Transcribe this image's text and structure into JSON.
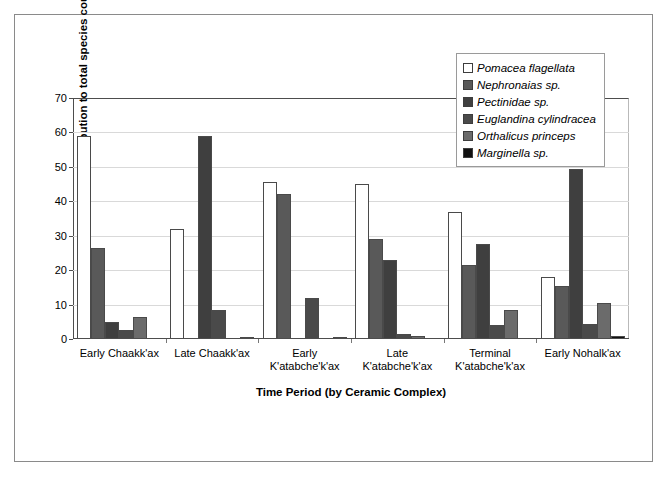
{
  "chart_data": {
    "type": "bar",
    "title": "",
    "xlabel": "Time Period (by Ceramic Complex)",
    "ylabel": "Percent contribution to total species count",
    "ylim": [
      0,
      70
    ],
    "yticks": [
      0,
      10,
      20,
      30,
      40,
      50,
      60,
      70
    ],
    "grid": true,
    "legend_position": "top-right",
    "categories": [
      "Early Chaakk'ax",
      "Late Chaakk'ax",
      "Early\nK'atabche'k'ax",
      "Late\nK'atabche'k'ax",
      "Terminal\nK'atabche'k'ax",
      "Early Nohalk'ax"
    ],
    "series": [
      {
        "name": "Pomacea flagellata",
        "color": "#ffffff",
        "values": [
          59.0,
          32.0,
          45.5,
          45.0,
          37.0,
          18.0
        ]
      },
      {
        "name": "Nephronaias sp.",
        "color": "#595959",
        "values": [
          26.5,
          0.0,
          42.0,
          29.0,
          21.5,
          15.5
        ]
      },
      {
        "name": "Pectinidae sp.",
        "color": "#3f3f3f",
        "values": [
          5.0,
          59.0,
          0.0,
          23.0,
          27.5,
          49.5
        ]
      },
      {
        "name": "Euglandina cylindracea",
        "color": "#4a4a4a",
        "values": [
          2.5,
          8.5,
          12.0,
          1.5,
          4.0,
          4.5
        ]
      },
      {
        "name": "Orthalicus princeps",
        "color": "#6b6b6b",
        "values": [
          6.5,
          0.0,
          0.0,
          1.0,
          8.5,
          10.5
        ]
      },
      {
        "name": "Marginella sp.",
        "color": "#111111",
        "values": [
          0.0,
          0.7,
          0.5,
          0.0,
          0.0,
          0.8
        ]
      }
    ]
  },
  "legend": {
    "items": [
      {
        "label": "Pomacea flagellata",
        "swatch": "#ffffff"
      },
      {
        "label": "Nephronaias sp.",
        "swatch": "#595959"
      },
      {
        "label": "Pectinidae sp.",
        "swatch": "#3f3f3f"
      },
      {
        "label": "Euglandina cylindracea",
        "swatch": "#4a4a4a"
      },
      {
        "label": "Orthalicus princeps",
        "swatch": "#6b6b6b"
      },
      {
        "label": "Marginella sp.",
        "swatch": "#111111"
      }
    ]
  },
  "axes": {
    "y_title": "Percent contribution to total species count",
    "x_title": "Time Period (by Ceramic Complex)",
    "y_tick_labels": [
      "0",
      "10",
      "20",
      "30",
      "40",
      "50",
      "60",
      "70"
    ],
    "x_tick_labels": [
      "Early Chaakk'ax",
      "Late Chaakk'ax",
      "Early|K'atabche'k'ax",
      "Late|K'atabche'k'ax",
      "Terminal|K'atabche'k'ax",
      "Early Nohalk'ax"
    ]
  }
}
